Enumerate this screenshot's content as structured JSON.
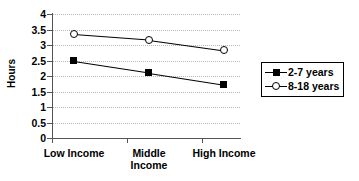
{
  "chart_data": {
    "type": "line",
    "title": "",
    "xlabel": "",
    "ylabel": "Hours",
    "categories": [
      "Low Income",
      "Middle Income",
      "High Income"
    ],
    "series": [
      {
        "name": "2-7 years",
        "marker": "filled-square",
        "values": [
          2.47,
          2.1,
          1.72
        ]
      },
      {
        "name": "8-18 years",
        "marker": "open-circle",
        "values": [
          3.35,
          3.17,
          2.83
        ]
      }
    ],
    "ylim": [
      0,
      4
    ],
    "yticks": [
      "0",
      "0.5",
      "1",
      "1.5",
      "2",
      "2.5",
      "3",
      "3.5",
      "4"
    ],
    "ytick_values": [
      0,
      0.5,
      1,
      1.5,
      2,
      2.5,
      3,
      3.5,
      4
    ],
    "grid": true,
    "grid_axis": "y",
    "legend_position": "right",
    "colors": {
      "line": "#000000",
      "grid": "#b9b9b9",
      "axis": "#555555",
      "background": "#ffffff"
    }
  },
  "axis": {
    "y_title": "Hours"
  },
  "legend": {
    "entries": [
      {
        "label": "2-7 years"
      },
      {
        "label": "8-18 years"
      }
    ]
  },
  "x_labels": [
    {
      "line1": "Low Income",
      "line2": ""
    },
    {
      "line1": "Middle",
      "line2": "Income"
    },
    {
      "line1": "High Income",
      "line2": ""
    }
  ]
}
